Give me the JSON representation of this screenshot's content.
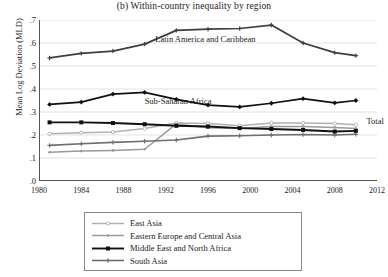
{
  "chart_data": {
    "type": "line",
    "title": "(b) Within-country inequality by region",
    "xlabel": "",
    "ylabel": "Mean Log Deviation (MLD)",
    "xlim": [
      1980,
      2012
    ],
    "ylim": [
      0.0,
      0.7
    ],
    "grid": true,
    "legend_position": "below-axes",
    "xticks": [
      "1980",
      "1984",
      "1988",
      "1992",
      "1996",
      "2000",
      "2004",
      "2008",
      "2012"
    ],
    "xtick_values": [
      1980,
      1984,
      1988,
      1992,
      1996,
      2000,
      2004,
      2008,
      2012
    ],
    "yticks": [
      ".0",
      ".1",
      ".2",
      ".3",
      ".4",
      ".5",
      ".6",
      ".7"
    ],
    "ytick_values": [
      0.0,
      0.1,
      0.2,
      0.3,
      0.4,
      0.5,
      0.6,
      0.7
    ],
    "x": [
      1981,
      1984,
      1987,
      1990,
      1993,
      1996,
      1999,
      2002,
      2005,
      2008,
      2010
    ],
    "series": [
      {
        "name": "Latin America and Caribbean",
        "color": "#3d3d3d",
        "width": 1.7,
        "marker": "plus",
        "in_plot_label": "Latin America and Caribbean",
        "values": [
          0.535,
          0.555,
          0.565,
          0.595,
          0.655,
          0.66,
          0.663,
          0.678,
          0.6,
          0.558,
          0.545
        ]
      },
      {
        "name": "Sub-Saharan Africa",
        "color": "#111111",
        "width": 1.7,
        "marker": "diamond",
        "in_plot_label": "Sub-Saharan Africa",
        "values": [
          0.333,
          0.343,
          0.378,
          0.385,
          0.355,
          0.33,
          0.322,
          0.338,
          0.358,
          0.34,
          0.35
        ]
      },
      {
        "name": "East Asia",
        "color": "#b0b0b0",
        "width": 1.5,
        "marker": "circle-open",
        "values": [
          0.205,
          0.21,
          0.213,
          0.228,
          0.252,
          0.25,
          0.24,
          0.252,
          0.252,
          0.25,
          0.245
        ]
      },
      {
        "name": "Eastern Europe and Central Asia",
        "color": "#9a9a9a",
        "width": 1.5,
        "marker": "dot",
        "values": [
          0.125,
          0.13,
          0.133,
          0.138,
          0.248,
          0.232,
          0.228,
          0.237,
          0.237,
          0.233,
          0.228
        ]
      },
      {
        "name": "Middle East and North Africa",
        "color": "#111111",
        "width": 1.9,
        "marker": "square",
        "values": [
          0.255,
          0.255,
          0.252,
          0.247,
          0.24,
          0.237,
          0.23,
          0.226,
          0.222,
          0.215,
          0.218
        ]
      },
      {
        "name": "South Asia",
        "color": "#6e6e6e",
        "width": 1.6,
        "marker": "plus",
        "values": [
          0.155,
          0.162,
          0.168,
          0.173,
          0.178,
          0.195,
          0.197,
          0.2,
          0.202,
          0.2,
          0.203
        ]
      }
    ],
    "annotations": [
      {
        "text": "Total",
        "series": "East Asia",
        "x": 2011,
        "y": 0.258
      }
    ]
  },
  "legend": {
    "items": [
      {
        "label": "East Asia"
      },
      {
        "label": "Eastern Europe and Central Asia"
      },
      {
        "label": "Middle East and North Africa"
      },
      {
        "label": "South Asia"
      }
    ]
  }
}
